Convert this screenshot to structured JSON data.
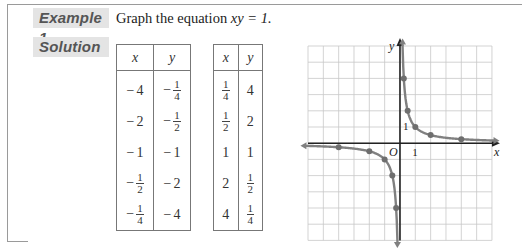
{
  "example": {
    "label": "Example 1",
    "prompt_prefix": "Graph the equation ",
    "equation": "xy = 1."
  },
  "solution": {
    "label": "Solution"
  },
  "table_left": {
    "headers": [
      "x",
      "y"
    ],
    "rows": [
      {
        "x": "−4",
        "y": "−1/4"
      },
      {
        "x": "−2",
        "y": "−1/2"
      },
      {
        "x": "−1",
        "y": "−1"
      },
      {
        "x": "−1/2",
        "y": "−2"
      },
      {
        "x": "−1/4",
        "y": "−4"
      }
    ]
  },
  "table_right": {
    "headers": [
      "x",
      "y"
    ],
    "rows": [
      {
        "x": "1/4",
        "y": "4"
      },
      {
        "x": "1/2",
        "y": "2"
      },
      {
        "x": "1",
        "y": "1"
      },
      {
        "x": "2",
        "y": "1/2"
      },
      {
        "x": "4",
        "y": "1/4"
      }
    ]
  },
  "graph": {
    "x_axis_label": "x",
    "y_axis_label": "y",
    "origin_label": "O",
    "x_tick_label": "1",
    "y_tick_label": "1",
    "x_range": [
      -6,
      6
    ],
    "y_range": [
      -6,
      6
    ],
    "curve_color": "#808080",
    "grid_color": "#c8c8c8",
    "axis_color": "#222222"
  },
  "chart_data": {
    "type": "line",
    "xlabel": "x",
    "ylabel": "y",
    "xlim": [
      -6,
      6
    ],
    "ylim": [
      -6,
      6
    ],
    "grid": true,
    "series": [
      {
        "name": "branch x<0",
        "x": [
          -4,
          -2,
          -1,
          -0.5,
          -0.25
        ],
        "y": [
          -0.25,
          -0.5,
          -1,
          -2,
          -4
        ]
      },
      {
        "name": "branch x>0",
        "x": [
          0.25,
          0.5,
          1,
          2,
          4
        ],
        "y": [
          4,
          2,
          1,
          0.5,
          0.25
        ]
      }
    ]
  }
}
